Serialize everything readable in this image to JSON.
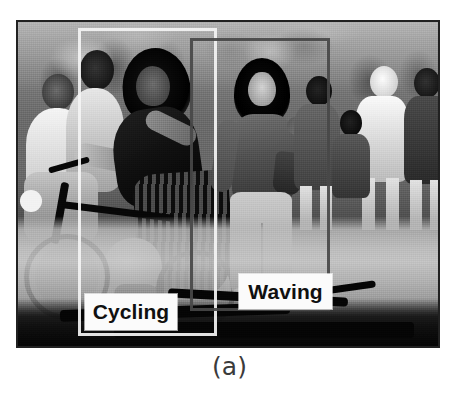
{
  "figure": {
    "caption": "(a)",
    "photo": {
      "description": "Grayscale street photograph of a crowd with a woman cycling on the left and a woman waving on the right",
      "alt_name": "street-scene-photo",
      "border_color": "#2b2b2b"
    },
    "detections": [
      {
        "id": "cycling",
        "label": "Cycling",
        "box_color": "#f4f4f4",
        "label_bg": "#fbfbfb",
        "label_color": "#101010",
        "x": 78,
        "y": 28,
        "width": 139,
        "height": 308
      },
      {
        "id": "waving",
        "label": "Waving",
        "box_color": "#484848",
        "label_bg": "#fbfbfb",
        "label_color": "#101010",
        "x": 190,
        "y": 38,
        "width": 140,
        "height": 273
      }
    ]
  },
  "colors": {
    "page_background": "#ffffff",
    "caption_text": "#3b3b3b"
  }
}
